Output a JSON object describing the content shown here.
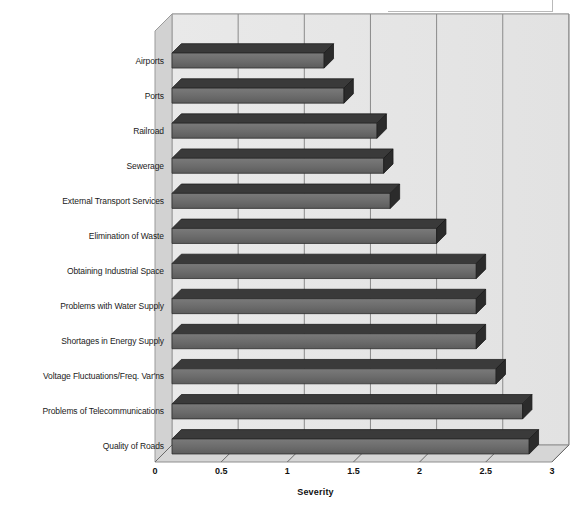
{
  "chart_data": {
    "type": "bar",
    "orientation": "horizontal",
    "title": "",
    "xlabel": "Severity",
    "ylabel": "",
    "xlim": [
      0,
      3
    ],
    "xticks": [
      0,
      0.5,
      1,
      1.5,
      2,
      2.5,
      3
    ],
    "xtick_labels": [
      "0",
      "0.5",
      "1",
      "1.5",
      "2",
      "2.5",
      "3"
    ],
    "grid": true,
    "legend": false,
    "style": "3d-bar",
    "categories": [
      "Airports",
      "Ports",
      "Railroad",
      "Sewerage",
      "External Transport Services",
      "Elimination of Waste",
      "Obtaining Industrial Space",
      "Problems with Water Supply",
      "Shortages in Energy Supply",
      "Voltage Fluctuations/Freq. Var'ns",
      "Problems of Telecommunications",
      "Quality of Roads"
    ],
    "values": [
      1.15,
      1.3,
      1.55,
      1.6,
      1.65,
      2.0,
      2.3,
      2.3,
      2.3,
      2.45,
      2.65,
      2.7
    ],
    "series": [
      {
        "name": "Severity",
        "values": [
          1.15,
          1.3,
          1.55,
          1.6,
          1.65,
          2.0,
          2.3,
          2.3,
          2.3,
          2.45,
          2.65,
          2.7
        ]
      }
    ]
  },
  "colors": {
    "bar_face": "#6e6e6e",
    "bar_top": "#3a3a3a",
    "bar_side": "#2b2b2b",
    "plot_background": "#e6e6e6",
    "floor": "#d6d6d6",
    "wall_back": "#ededed",
    "gridline": "#8a8a8a",
    "text": "#1a1a1a",
    "page_background": "#ffffff"
  },
  "axis": {
    "title": "Severity"
  }
}
